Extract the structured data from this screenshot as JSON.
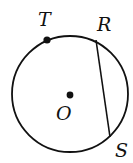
{
  "diagram": {
    "type": "circle-geometry",
    "stroke_color": "#111111",
    "background": "#ffffff",
    "circle": {
      "center_label": "O",
      "cx": 70,
      "cy": 93,
      "r": 58
    },
    "points": [
      {
        "label": "T",
        "x": 47,
        "y": 40,
        "on_circle": true,
        "marked": true
      },
      {
        "label": "R",
        "x": 96,
        "y": 40,
        "on_circle": true,
        "marked": false
      },
      {
        "label": "S",
        "x": 110,
        "y": 137,
        "on_circle": true,
        "marked": false
      },
      {
        "label": "O",
        "x": 70,
        "y": 95,
        "on_circle": false,
        "marked": true
      }
    ],
    "segments": [
      {
        "from": "R",
        "to": "S",
        "kind": "chord"
      }
    ],
    "labels": {
      "T": "T",
      "R": "R",
      "O": "O",
      "S": "S"
    }
  }
}
